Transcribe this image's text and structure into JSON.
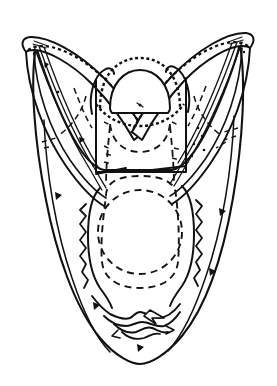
{
  "figure": {
    "title": "Skull in palatal/ventral view",
    "domain_kind": "anatomical line drawing",
    "canvas": {
      "width": 277,
      "height": 386
    },
    "colors": {
      "background": "#ffffff",
      "ink": "#111111",
      "dashed_ink": "#141414"
    },
    "caption": "",
    "labels": []
  },
  "parts": [
    {
      "id": "left-horn",
      "name": "left posterior horn",
      "description": "elongate tapering process sweeping up and outward to the upper left, outlined with a beaded/stippled margin"
    },
    {
      "id": "right-horn",
      "name": "right posterior horn",
      "description": "mirror image of the left horn, sweeping up and outward to the upper right"
    },
    {
      "id": "occipital-dome",
      "name": "occipital condyle dome",
      "description": "rounded dome at the top centre, capped by an arching beaded band"
    },
    {
      "id": "central-panel",
      "name": "central occipital panel",
      "description": "trapezoidal panel below the dome, bounded by straight solid lines"
    },
    {
      "id": "dashed-plate",
      "name": "interior dashed plate outline",
      "description": "rounded-rectangular dashed outline occupying the middle of the body"
    },
    {
      "id": "dashed-circle",
      "name": "interior dashed circle",
      "description": "large dashed circle nested inside the dashed plate"
    },
    {
      "id": "body-margin",
      "name": "outer cranial margin",
      "description": "broad U-shaped outer contour tapering to a rounded anterior tip"
    },
    {
      "id": "suture-complex",
      "name": "anterior suture complex",
      "description": "irregular jagged suture lines near the rounded anterior end"
    },
    {
      "id": "hatch-struts",
      "name": "internal hatched struts",
      "description": "pairs of long parallel ruled lines running inside each horn"
    }
  ]
}
